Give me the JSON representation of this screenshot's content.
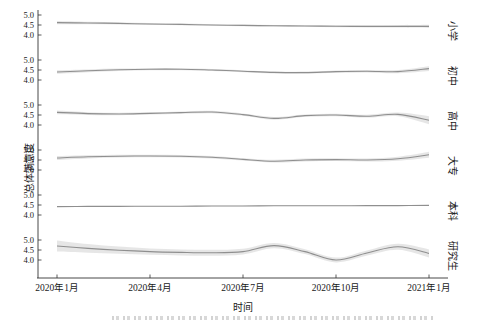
{
  "figure": {
    "y_axis_title": "总体满意度",
    "x_axis_title": "时间",
    "facet_axis_label": "受教育程度"
  },
  "chart_data": {
    "type": "line",
    "subtype": "smoothed-trend-with-confidence-band",
    "layout": "vertical-facets-shared-x",
    "title": "",
    "xlabel": "时间",
    "ylabel": "总体满意度",
    "facet_axis_label": "受教育程度",
    "grid": false,
    "legend": "none",
    "x_range_months": 13,
    "x_tick_positions": [
      0,
      3,
      6,
      9,
      12
    ],
    "x_tick_labels": [
      "2020年1月",
      "2020年4月",
      "2020年7月",
      "2020年10月",
      "2021年1月"
    ],
    "y_ticks": [
      5.0,
      4.5,
      4.0
    ],
    "y_tick_labels": [
      "5.0",
      "4.5",
      "4.0"
    ],
    "panel_value_range": [
      3.15,
      5.25
    ],
    "facets": [
      {
        "label": "小学",
        "mean": [
          4.62,
          4.6,
          4.58,
          4.55,
          4.53,
          4.5,
          4.48,
          4.46,
          4.45,
          4.44,
          4.43,
          4.43,
          4.43
        ],
        "ci": [
          0.08,
          0.06,
          0.05,
          0.05,
          0.04,
          0.04,
          0.04,
          0.04,
          0.04,
          0.05,
          0.05,
          0.06,
          0.08
        ]
      },
      {
        "label": "初中",
        "mean": [
          4.4,
          4.46,
          4.51,
          4.54,
          4.54,
          4.5,
          4.44,
          4.38,
          4.37,
          4.42,
          4.44,
          4.42,
          4.57
        ],
        "ci": [
          0.09,
          0.07,
          0.06,
          0.05,
          0.05,
          0.05,
          0.05,
          0.05,
          0.05,
          0.06,
          0.06,
          0.08,
          0.12
        ]
      },
      {
        "label": "高中",
        "mean": [
          4.63,
          4.57,
          4.55,
          4.58,
          4.62,
          4.65,
          4.52,
          4.33,
          4.47,
          4.5,
          4.44,
          4.53,
          4.24
        ],
        "ci": [
          0.09,
          0.07,
          0.06,
          0.06,
          0.06,
          0.06,
          0.06,
          0.07,
          0.06,
          0.06,
          0.07,
          0.09,
          0.2
        ]
      },
      {
        "label": "大专",
        "mean": [
          4.6,
          4.66,
          4.69,
          4.7,
          4.69,
          4.64,
          4.53,
          4.44,
          4.5,
          4.52,
          4.5,
          4.56,
          4.76
        ],
        "ci": [
          0.1,
          0.08,
          0.07,
          0.06,
          0.06,
          0.06,
          0.06,
          0.07,
          0.07,
          0.07,
          0.08,
          0.1,
          0.15
        ]
      },
      {
        "label": "本科",
        "mean": [
          4.42,
          4.43,
          4.43,
          4.44,
          4.44,
          4.45,
          4.45,
          4.46,
          4.46,
          4.46,
          4.47,
          4.47,
          4.48
        ],
        "ci": [
          0.02,
          0.02,
          0.015,
          0.015,
          0.015,
          0.015,
          0.015,
          0.015,
          0.015,
          0.015,
          0.015,
          0.02,
          0.02
        ]
      },
      {
        "label": "研究生",
        "mean": [
          4.7,
          4.58,
          4.49,
          4.42,
          4.38,
          4.36,
          4.42,
          4.72,
          4.42,
          4.0,
          4.35,
          4.66,
          4.33
        ],
        "ci": [
          0.28,
          0.22,
          0.18,
          0.16,
          0.15,
          0.15,
          0.14,
          0.13,
          0.12,
          0.12,
          0.13,
          0.15,
          0.2
        ]
      }
    ],
    "colors": {
      "line": "#8f8f8f",
      "band": "#d2d2d2",
      "axis": "#333333",
      "text": "#1a1a1a"
    }
  }
}
